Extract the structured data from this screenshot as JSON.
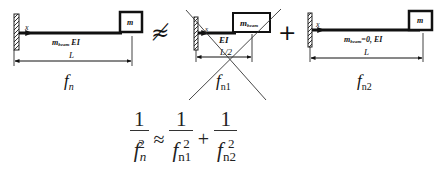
{
  "diagram": {
    "figures": [
      {
        "id": "full-system",
        "mass_label": "m",
        "x_label": "x",
        "beam_label": "m_beam EI",
        "beam_label_main": "m",
        "beam_label_sub": "beam",
        "beam_label_suffix": " EI",
        "length_label": "L",
        "frequency_label": "f",
        "frequency_sub": "n"
      },
      {
        "id": "beam-only",
        "mass_label": "m_beam",
        "mass_label_main": "m",
        "mass_label_sub": "beam",
        "x_label": "x",
        "beam_label": "EI",
        "length_label": "L/2",
        "frequency_label": "f",
        "frequency_sub": "n1",
        "crossed_out": true
      },
      {
        "id": "massless-beam",
        "mass_label": "m",
        "x_label": "x",
        "beam_label": "m_beam=0, EI",
        "beam_label_main": "m",
        "beam_label_sub": "beam",
        "beam_label_suffix": "=0, EI",
        "length_label": "L",
        "frequency_label": "f",
        "frequency_sub": "n2"
      }
    ],
    "operators": {
      "approx_not_equal": "≉",
      "plus": "+"
    },
    "equation": {
      "text": "1/f_n^2 ≈ 1/f_n1^2 + 1/f_n2^2",
      "numerator": "1",
      "terms": [
        {
          "base": "f",
          "sub": "n",
          "sup": "2"
        },
        {
          "base": "f",
          "sub": "n1",
          "sup": "2"
        },
        {
          "base": "f",
          "sub": "n2",
          "sup": "2"
        }
      ],
      "approx": "≈",
      "plus": "+"
    }
  }
}
